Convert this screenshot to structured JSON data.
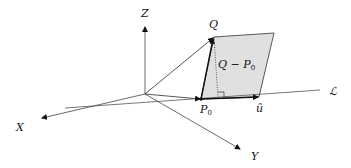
{
  "diagram": {
    "title": "",
    "labels": {
      "z_axis": "Z",
      "x_axis": "X",
      "y_axis": "Y",
      "point_q": "Q",
      "point_p0": "P",
      "point_p0_sub": "0",
      "vector_q_minus_p0": "Q − P",
      "vector_q_minus_p0_sub": "0",
      "unit_vector": "û",
      "line": "ℒ"
    },
    "colors": {
      "parallelogram_fill": "#e0e0e0",
      "axis": "#444444",
      "stroke": "#111111"
    }
  }
}
